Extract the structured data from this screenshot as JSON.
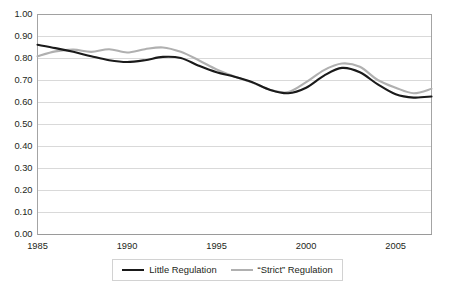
{
  "chart_data": {
    "type": "line",
    "title": "",
    "xlabel": "",
    "ylabel": "",
    "xlim": [
      1985,
      2007
    ],
    "ylim": [
      0.0,
      1.0
    ],
    "grid": true,
    "legend_position": "bottom",
    "y_ticks": [
      "0.00",
      "0.10",
      "0.20",
      "0.30",
      "0.40",
      "0.50",
      "0.60",
      "0.70",
      "0.80",
      "0.90",
      "1.00"
    ],
    "y_tick_values": [
      0.0,
      0.1,
      0.2,
      0.3,
      0.4,
      0.5,
      0.6,
      0.7,
      0.8,
      0.9,
      1.0
    ],
    "x_ticks": [
      "1985",
      "1990",
      "1995",
      "2000",
      "2005"
    ],
    "x_tick_values": [
      1985,
      1990,
      1995,
      2000,
      2005
    ],
    "x": [
      1985,
      1986,
      1987,
      1988,
      1989,
      1990,
      1991,
      1992,
      1993,
      1994,
      1995,
      1996,
      1997,
      1998,
      1999,
      2000,
      2001,
      2002,
      2003,
      2004,
      2005,
      2006,
      2007
    ],
    "series": [
      {
        "name": "Little Regulation",
        "color": "#1a1a1a",
        "width": 2.1,
        "values": [
          0.86,
          0.845,
          0.828,
          0.808,
          0.79,
          0.782,
          0.79,
          0.805,
          0.8,
          0.765,
          0.735,
          0.715,
          0.69,
          0.655,
          0.64,
          0.665,
          0.72,
          0.755,
          0.735,
          0.68,
          0.635,
          0.62,
          0.625
        ]
      },
      {
        "name": "“Strict” Regulation",
        "color": "#b0b0b0",
        "width": 2.1,
        "values": [
          0.808,
          0.83,
          0.838,
          0.828,
          0.84,
          0.825,
          0.84,
          0.848,
          0.828,
          0.79,
          0.748,
          0.716,
          0.688,
          0.655,
          0.645,
          0.69,
          0.745,
          0.775,
          0.76,
          0.7,
          0.665,
          0.64,
          0.66
        ]
      }
    ]
  },
  "legend": {
    "entries": [
      {
        "label": "Little Regulation"
      },
      {
        "label": "“Strict” Regulation"
      }
    ]
  },
  "caption": {
    "text": ""
  }
}
